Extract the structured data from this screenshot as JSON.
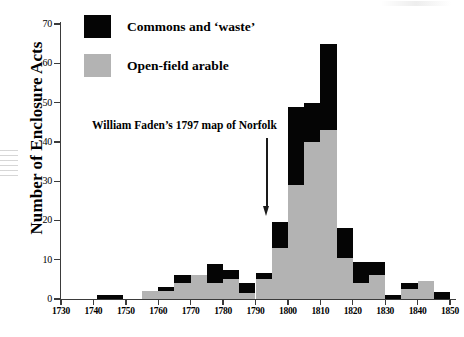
{
  "chart_data": {
    "type": "bar",
    "subtype": "stacked-histogram",
    "title": "",
    "xlabel": "",
    "ylabel": "Number of Enclosure Acts",
    "xlim": [
      1730,
      1850
    ],
    "ylim": [
      0,
      70
    ],
    "ytick_labels": [
      "0",
      "10",
      "20",
      "30",
      "40",
      "50",
      "60",
      "70"
    ],
    "yticks": [
      0,
      10,
      20,
      30,
      40,
      50,
      60,
      70
    ],
    "xtick_labels": [
      "1730",
      "1740",
      "1750",
      "1760",
      "1770",
      "1780",
      "1790",
      "1800",
      "1810",
      "1820",
      "1830",
      "1840",
      "1850"
    ],
    "xticks": [
      1730,
      1740,
      1750,
      1760,
      1770,
      1780,
      1790,
      1800,
      1810,
      1820,
      1830,
      1840,
      1850
    ],
    "grid": false,
    "legend_position": "top-left",
    "series": [
      {
        "name": "Open-field arable",
        "color": "#b3b3b3"
      },
      {
        "name": "Commons and 'waste'",
        "color": "#050505"
      }
    ],
    "bins": [
      {
        "start": 1741,
        "end": 1749,
        "open_field": 0,
        "commons": 1,
        "total": 1
      },
      {
        "start": 1755,
        "end": 1760,
        "open_field": 2,
        "commons": 0,
        "total": 2
      },
      {
        "start": 1760,
        "end": 1765,
        "open_field": 2,
        "commons": 1,
        "total": 3
      },
      {
        "start": 1765,
        "end": 1770,
        "open_field": 4,
        "commons": 2,
        "total": 6
      },
      {
        "start": 1770,
        "end": 1775,
        "open_field": 6,
        "commons": 0,
        "total": 6
      },
      {
        "start": 1775,
        "end": 1780,
        "open_field": 4,
        "commons": 5,
        "total": 9
      },
      {
        "start": 1780,
        "end": 1785,
        "open_field": 5,
        "commons": 2.5,
        "total": 7.5
      },
      {
        "start": 1785,
        "end": 1790,
        "open_field": 1.5,
        "commons": 2.5,
        "total": 4
      },
      {
        "start": 1790,
        "end": 1795,
        "open_field": 5,
        "commons": 1.5,
        "total": 6.5
      },
      {
        "start": 1795,
        "end": 1800,
        "open_field": 13,
        "commons": 6.5,
        "total": 19.5
      },
      {
        "start": 1800,
        "end": 1805,
        "open_field": 29,
        "commons": 20,
        "total": 49
      },
      {
        "start": 1805,
        "end": 1810,
        "open_field": 40,
        "commons": 10,
        "total": 50
      },
      {
        "start": 1810,
        "end": 1815,
        "open_field": 43,
        "commons": 22,
        "total": 65
      },
      {
        "start": 1815,
        "end": 1820,
        "open_field": 10.5,
        "commons": 7.5,
        "total": 18
      },
      {
        "start": 1820,
        "end": 1825,
        "open_field": 4,
        "commons": 5.5,
        "total": 9.5
      },
      {
        "start": 1825,
        "end": 1830,
        "open_field": 6,
        "commons": 3.5,
        "total": 9.5
      },
      {
        "start": 1830,
        "end": 1835,
        "open_field": 0,
        "commons": 1,
        "total": 1
      },
      {
        "start": 1835,
        "end": 1840,
        "open_field": 2.5,
        "commons": 1.5,
        "total": 4
      },
      {
        "start": 1840,
        "end": 1845,
        "open_field": 4.5,
        "commons": 0,
        "total": 4.5
      },
      {
        "start": 1845,
        "end": 1850,
        "open_field": 0,
        "commons": 1.8,
        "total": 1.8
      }
    ]
  },
  "legend": {
    "items": [
      {
        "label": "Commons and ‘waste’",
        "color": "#050505"
      },
      {
        "label": "Open-field arable",
        "color": "#b3b3b3"
      }
    ]
  },
  "annotation": {
    "text": "William Faden’s 1797 map of Norfolk",
    "points_to_year": 1797
  },
  "axes": {
    "y_title": "Number of Enclosure Acts"
  }
}
